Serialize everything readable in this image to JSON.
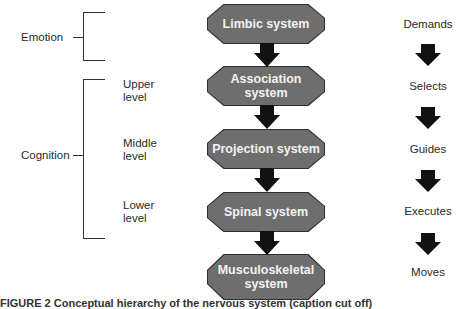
{
  "left": {
    "emotion": {
      "label": "Emotion"
    },
    "cognition": {
      "label": "Cognition",
      "levels": [
        "Upper\nlevel",
        "Middle\nlevel",
        "Lower\nlevel"
      ],
      "levels_line1": [
        "Upper",
        "Middle",
        "Lower"
      ],
      "levels_line2": [
        "level",
        "level",
        "level"
      ]
    }
  },
  "center": {
    "systems": [
      {
        "label": "Limbic system"
      },
      {
        "label": "Association system"
      },
      {
        "label": "Projection system"
      },
      {
        "label": "Spinal system"
      },
      {
        "label": "Musculoskeletal system",
        "line1": "Musculoskeletal",
        "line2": "system"
      }
    ],
    "box_color": "#6e6e6e",
    "arrow_color": "#111111"
  },
  "right": {
    "actions": [
      "Demands",
      "Selects",
      "Guides",
      "Executes",
      "Moves"
    ]
  },
  "caption": {
    "text": "FIGURE 2  Conceptual hierarchy of the nervous system (caption cut off)"
  }
}
